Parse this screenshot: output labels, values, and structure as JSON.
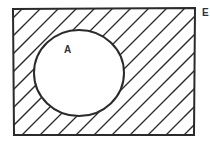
{
  "diagram": {
    "type": "venn",
    "universal_set_label": "E",
    "set_label": "A",
    "shaded_region": "complement of A",
    "stroke_color": "#2a2a2a",
    "background": "#ffffff",
    "rect": {
      "x": 13,
      "y": 9,
      "w": 182,
      "h": 126
    },
    "circle": {
      "cx": 79,
      "cy": 73,
      "rx": 45,
      "ry": 43
    }
  }
}
